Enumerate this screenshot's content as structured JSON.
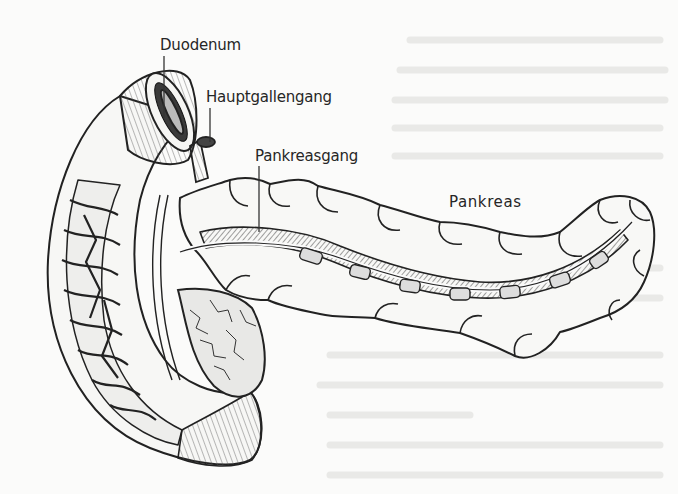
{
  "diagram": {
    "labels": [
      {
        "id": "duodenum",
        "text": "Duodenum"
      },
      {
        "id": "hauptgallengang",
        "text": "Hauptgallengang"
      },
      {
        "id": "pankreasgang",
        "text": "Pankreasgang"
      },
      {
        "id": "pankreas",
        "text": "Pankreas"
      }
    ],
    "colors": {
      "ink": "#262626",
      "paper": "#fbfbfa",
      "ghost_text": "#e6e6e3"
    }
  }
}
